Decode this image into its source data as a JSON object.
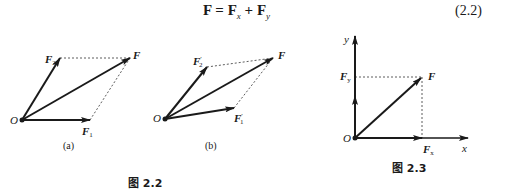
{
  "equation": {
    "lhs": "F",
    "eq": " = ",
    "t1": "F",
    "t1_sub": "x",
    "plus": " + ",
    "t2": "F",
    "t2_sub": "y",
    "number": "(2.2)"
  },
  "figure_2_2": {
    "caption": "图 2.2",
    "panel_a": {
      "label": "(a)",
      "origin": "O",
      "vectors": [
        "F",
        "F₁",
        "F₂"
      ],
      "labels": {
        "origin": "O",
        "F": "F",
        "F1": "F",
        "F1_sub": "1",
        "F2": "F",
        "F2_sub": "2"
      }
    },
    "panel_b": {
      "label": "(b)",
      "origin": "O",
      "vectors": [
        "F",
        "F₁′",
        "F₂′"
      ],
      "labels": {
        "origin": "O",
        "F": "F",
        "F1": "F",
        "F1_sub": "1",
        "F1_prime": "′",
        "F2": "F",
        "F2_sub": "2",
        "F2_prime": "′"
      }
    }
  },
  "figure_2_3": {
    "caption": "图 2.3",
    "labels": {
      "origin": "O",
      "x_axis": "x",
      "y_axis": "y",
      "F": "F",
      "Fx": "F",
      "Fx_sub": "x",
      "Fy": "F",
      "Fy_sub": "y"
    }
  },
  "colors": {
    "ink": "#1a1a1a",
    "background": "#ffffff"
  }
}
